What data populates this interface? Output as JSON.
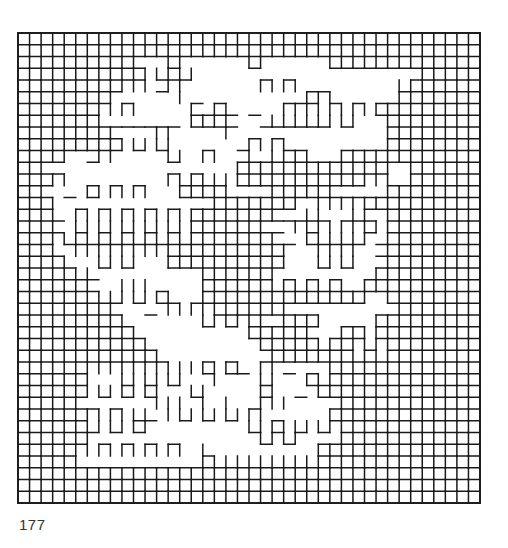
{
  "figure": {
    "plate_number": "177",
    "grid": {
      "origin_x": 18,
      "origin_y": 33,
      "cols": 40,
      "rows": 40,
      "cell_w": 11.55,
      "cell_h": 11.75,
      "stroke_color": "#1a1a1a",
      "stroke_width": 1.5
    },
    "legend": {
      "#": "full cell (all four edges)",
      "u": "open-top cup (left, right, bottom edges)",
      "n": "open-bottom arch (left, right, top edges)",
      "-": "horizontal stroke (bottom edge)",
      "|": "vertical stroke (left edge)",
      ".": "empty (eroded)"
    },
    "mask": [
      "########################################",
      "##########u#u#u#######u#u#u#############",
      "##########...#......u......#############",
      "#########u#.u#u....................#####",
      "########u.n.-n.......n.n.........u######",
      "#######n......|-........-nn-.....#######",
      "#######n.n.....|-#-.-..n.n.n.n.#########",
      "######u-------.###-..-u-u-u.u...########",
      "########-...||....|.............########",
      "######u.u.u.u......-n.n.........########",
      "###u..-n.....u..n...|.|#n...#############",
      "##...........-.....#########.##u..#######",
      "###n.........n.n.u.###########.n..#######",
      "##..-.#.n.n...####...-#####-----#########",
      "###..-...........#######..n.n.#########",
      "###-.n.n.n.n.n.#######--.u...u..########",
      "###-.u.u.u.u.u.######--.n-n.n.#.########",
      "###.u.u.u.u.u.u#######--.u.u.u.-########",
      "###..n.n.n.n.##########...n.n..-########",
      "####-..u.u...##########...u.u...########",
      "#####u-.........######|-.......#########",
      "######-..|||-...######.n.n.n..##########",
      "#######.u.u.u...##############..########",
      "########-..-.n.n.######-.........#######",
      "#########-......u.u.u..###.....#########",
      "##########-.........#####-..##.#########",
      "###########-.........####n.n.n.n########",
      "############-.........#######.#.########",
      "######n.n.n.n.||#|#-.n.-...u.#.#########",
      "######|..u.u.u...|...u...#-u############",
      "#####u.u.u.u...u.....u..-.u#############",
      "#####.......|||.|.|..n.|....u###########",
      "######n.n.u-.|u|u.u|n|-....#.###########",
      "######u.u.u.........u.u.u.u.############",
      "######...............u.u....############",
      "#####n.n.n.n.n..|.........##############",
      "#####...........#u.u.u.u.u.u############",
      "########################################",
      "########################################",
      "########################################"
    ]
  }
}
